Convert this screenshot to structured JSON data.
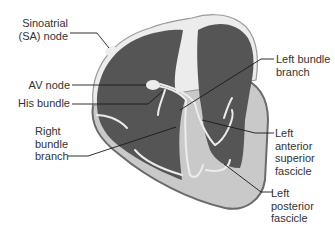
{
  "diagram": {
    "colors": {
      "chamber": "#555555",
      "wall": "#c9c9c9",
      "outline": "#6a6a6a",
      "conduction": "#ececec",
      "leader": "#1a1a1a",
      "text": "#333333"
    },
    "labels": {
      "sa_node": [
        "Sinoatrial",
        "(SA) node"
      ],
      "av_node": [
        "AV node"
      ],
      "his_bundle": [
        "His bundle"
      ],
      "right_bundle_branch": [
        "Right",
        "bundle",
        "branch"
      ],
      "left_bundle_branch": [
        "Left bundle",
        "branch"
      ],
      "left_anterior_superior_fascicle": [
        "Left",
        "anterior",
        "superior",
        "fascicle"
      ],
      "left_posterior_fascicle": [
        "Left",
        "posterior",
        "fascicle"
      ]
    }
  }
}
